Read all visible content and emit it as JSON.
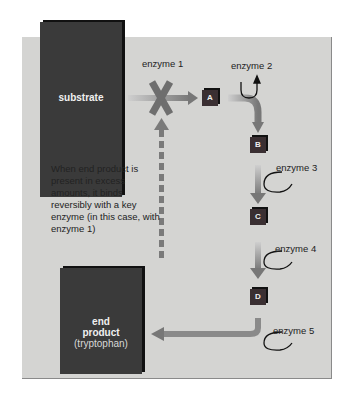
{
  "diagram": {
    "substrate_label": "substrate",
    "end_product": {
      "line1": "end",
      "line2": "product",
      "line3": "(tryptophan)"
    },
    "intermediates": [
      "A",
      "B",
      "C",
      "D"
    ],
    "enzymes": [
      "enzyme 1",
      "enzyme 2",
      "enzyme 3",
      "enzyme 4",
      "enzyme 5"
    ],
    "feedback_note": "When end product is present in excess amounts, it binds reversibly with a key enzyme (in this case, with enzyme 1)",
    "colors": {
      "panel": "#d4d4d2",
      "box": "#3a3a3a",
      "arrow": "#7a7a7a"
    }
  }
}
